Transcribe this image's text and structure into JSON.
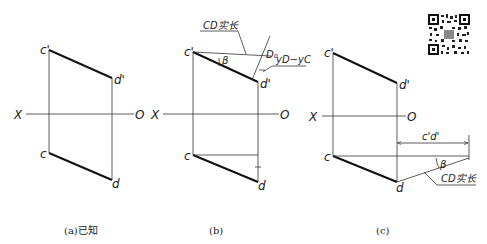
{
  "figure": {
    "panels": [
      {
        "id": "a",
        "caption": "(a)已知",
        "axis_left_label": "X",
        "axis_right_label": "O",
        "points": {
          "c_prime": "c'",
          "d_prime": "d'",
          "c": "c",
          "d": "d"
        }
      },
      {
        "id": "b",
        "caption": "(b)",
        "axis_left_label": "X",
        "axis_right_label": "O",
        "points": {
          "c_prime": "c'",
          "d_prime": "d'",
          "c": "c",
          "d": "d"
        },
        "annotations": {
          "true_length": "CD实长",
          "angle": "β",
          "d0_label": "D₀",
          "offset_label": "yD−yC"
        }
      },
      {
        "id": "c",
        "caption": "(c)",
        "axis_left_label": "X",
        "axis_right_label": "O",
        "points": {
          "c_prime": "c'",
          "d_prime": "d'",
          "c": "c",
          "d": "d"
        },
        "annotations": {
          "dimension": "c'd'",
          "angle": "β",
          "true_length": "CD实长"
        }
      }
    ],
    "qr_code": "qr-code"
  }
}
